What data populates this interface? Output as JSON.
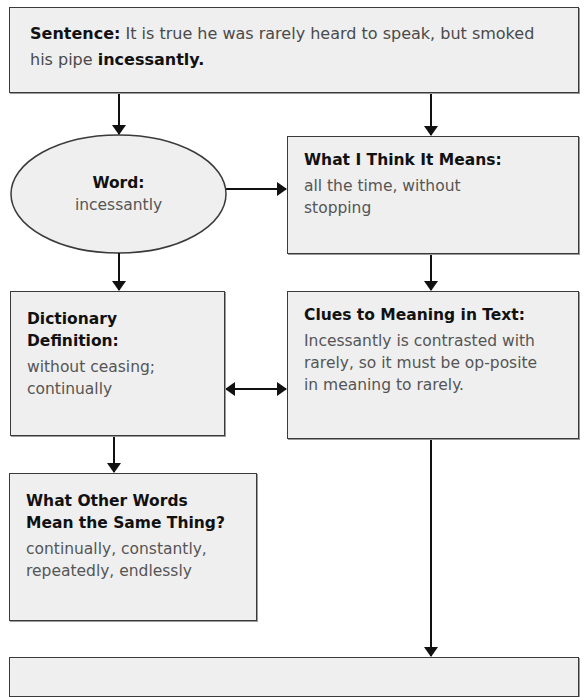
{
  "sentence": {
    "label": "Sentence:",
    "text_before": " It is true he was rarely heard to speak, but smoked his pipe ",
    "highlight": "incessantly."
  },
  "word": {
    "label": "Word:",
    "value": "incessantly"
  },
  "what_i_think": {
    "label": "What I Think It Means:",
    "value": "all the time, without stopping"
  },
  "dictionary": {
    "label_line1": "Dictionary",
    "label_line2": "Definition:",
    "value": "without ceasing; continually"
  },
  "clues": {
    "label": "Clues to Meaning in Text:",
    "value": "Incessantly is contrasted with rarely, so it must be op-posite in meaning to rarely."
  },
  "other_words": {
    "label_line1": "What Other Words",
    "label_line2": "Mean the Same Thing?",
    "value": "continually, constantly, repeatedly, endlessly"
  },
  "bottom_box": {
    "label": ""
  },
  "colors": {
    "box_fill": "#efefef",
    "stroke": "#3a3a3a",
    "heading": "#111111",
    "body": "#555555"
  }
}
